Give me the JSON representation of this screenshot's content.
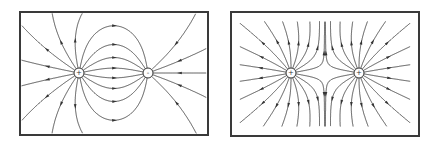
{
  "figure": {
    "panels": [
      {
        "id": "dipole",
        "description": "Electric field lines between a positive and a negative point charge",
        "charges": [
          {
            "sign": "+",
            "symbol": "+",
            "x": 79,
            "y": 73
          },
          {
            "sign": "-",
            "symbol": "-",
            "x": 148,
            "y": 73
          }
        ]
      },
      {
        "id": "like-charges",
        "description": "Electric field lines of two equal positive point charges",
        "charges": [
          {
            "sign": "+",
            "symbol": "+",
            "x": 291,
            "y": 73
          },
          {
            "sign": "+",
            "symbol": "+",
            "x": 359,
            "y": 73
          }
        ]
      }
    ],
    "line_color": "#444444",
    "border_color": "#3a3a3a"
  }
}
